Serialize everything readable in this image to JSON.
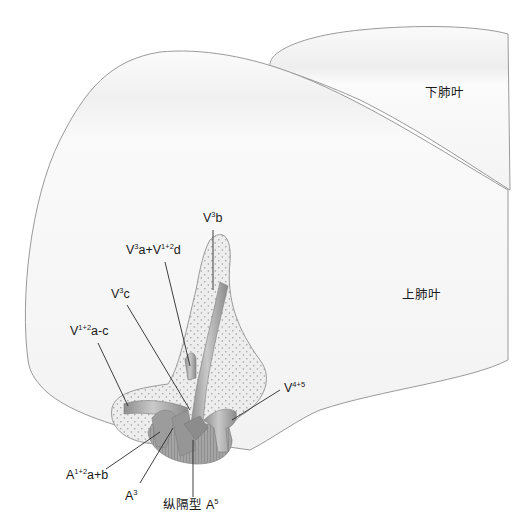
{
  "diagram": {
    "type": "anatomical-illustration",
    "lobes": {
      "lower": "下肺叶",
      "upper": "上肺叶"
    },
    "labels": {
      "v3b": {
        "base": "V",
        "sup": "3",
        "suffix": "b"
      },
      "v3a": {
        "base": "V",
        "sup": "3",
        "mid": "a+V",
        "sup2": "1+2",
        "suffix": "d"
      },
      "v3c": {
        "base": "V",
        "sup": "3",
        "suffix": "c"
      },
      "v12ac": {
        "base": "V",
        "sup": "1+2",
        "suffix": "a-c"
      },
      "v45": {
        "base": "V",
        "sup": "4+5",
        "suffix": ""
      },
      "a12ab": {
        "base": "A",
        "sup": "1+2",
        "suffix": "a+b"
      },
      "a3": {
        "base": "A",
        "sup": "3",
        "suffix": ""
      },
      "a5": {
        "prefix": "纵隔型 ",
        "base": "A",
        "sup": "5",
        "suffix": ""
      }
    },
    "colors": {
      "lobe_fill": "#f3f3f3",
      "lobe_edge": "#9a9a9a",
      "vessel": "#a8a8a8",
      "vessel_dark": "#8a8a8a",
      "stipple_fill": "#ececec",
      "stipple_dot": "#9c9c9c",
      "leader": "#2a2a2a",
      "text": "#1a1a1a"
    }
  }
}
